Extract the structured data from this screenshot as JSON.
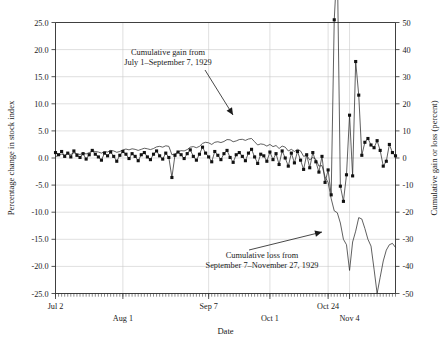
{
  "chart_data": {
    "type": "line",
    "title": "",
    "xlabel": "Date",
    "ylabel": "Percentage change in stock index",
    "y2label": "Cumulative gain or loss (percent)",
    "ylim": [
      -25.0,
      25.0
    ],
    "y2lim": [
      -50,
      50
    ],
    "grid": true,
    "legend_position": "none",
    "yticks": [
      "25.0",
      "20.0",
      "15.0",
      "10.0",
      "5.0",
      "0.0",
      "-5.0",
      "-10.0",
      "-15.0",
      "-20.0",
      "-25.0"
    ],
    "ytick_values": [
      25.0,
      20.0,
      15.0,
      10.0,
      5.0,
      0.0,
      -5.0,
      -10.0,
      -15.0,
      -20.0,
      -25.0
    ],
    "y2ticks": [
      "50",
      "40",
      "30",
      "20",
      "10",
      "0",
      "-10",
      "-20",
      "-30",
      "-40",
      "-50"
    ],
    "y2tick_values": [
      50,
      40,
      30,
      20,
      10,
      0,
      -10,
      -20,
      -30,
      -40,
      -50
    ],
    "xticks": [
      {
        "label": "Jul 2",
        "index": 0,
        "row": 0
      },
      {
        "label": "Aug 1",
        "index": 22,
        "row": 1
      },
      {
        "label": "Sep 7",
        "index": 50,
        "row": 0
      },
      {
        "label": "Oct 1",
        "index": 70,
        "row": 1
      },
      {
        "label": "Oct 24",
        "index": 89,
        "row": 0
      },
      {
        "label": "Nov 4",
        "index": 96,
        "row": 1
      }
    ],
    "n_points": 112,
    "annotations": [
      {
        "name": "cumulative-gain-annotation",
        "lines": [
          "Cumulative gain from",
          "July 1–September 7, 1929"
        ],
        "text_x": 168,
        "text_y": 55,
        "arrow_from_x": 205,
        "arrow_from_y": 70,
        "arrow_to_x": 233,
        "arrow_to_y": 115
      },
      {
        "name": "cumulative-loss-annotation",
        "lines": [
          "Cumulative loss from",
          "September 7–November 27, 1929"
        ],
        "text_x": 262,
        "text_y": 258,
        "arrow_from_x": 249,
        "arrow_from_y": 250,
        "arrow_to_x": 322,
        "arrow_to_y": 232
      }
    ],
    "series": [
      {
        "name": "Percentage change in stock index",
        "axis": "left",
        "marker": "square",
        "values": [
          1.0,
          0.6,
          1.2,
          0.3,
          0.9,
          0.2,
          1.3,
          0.5,
          0.1,
          0.8,
          -0.2,
          0.6,
          1.4,
          0.7,
          0.2,
          -0.4,
          0.9,
          0.4,
          1.1,
          0.3,
          -0.6,
          0.5,
          1.2,
          0.7,
          -0.1,
          0.8,
          0.3,
          -0.5,
          0.6,
          1.0,
          0.2,
          -0.3,
          0.7,
          1.3,
          0.4,
          -0.2,
          0.9,
          0.1,
          -3.6,
          0.5,
          1.1,
          0.6,
          -0.1,
          0.8,
          1.5,
          0.3,
          -0.4,
          0.7,
          2.0,
          0.9,
          0.2,
          -0.7,
          1.2,
          0.5,
          -0.3,
          0.8,
          1.4,
          0.1,
          -0.8,
          0.6,
          1.0,
          0.3,
          -0.5,
          0.9,
          1.6,
          0.2,
          -1.0,
          0.7,
          0.4,
          -0.6,
          1.1,
          -0.3,
          0.8,
          -1.2,
          1.3,
          0.0,
          -1.5,
          0.9,
          -0.9,
          1.2,
          -0.4,
          -2.1,
          0.6,
          -1.8,
          1.0,
          -0.7,
          -2.6,
          0.3,
          -4.5,
          -2.2,
          -6.8,
          25.5,
          36.2,
          -5.2,
          -8.0,
          -3.1,
          7.9,
          -3.3,
          17.8,
          11.6,
          0.5,
          2.9,
          3.6,
          2.4,
          1.9,
          3.2,
          1.4,
          -1.5,
          -0.6,
          2.5,
          1.0,
          0.4
        ]
      },
      {
        "name": "Cumulative gain or loss",
        "axis": "right",
        "marker": "none",
        "values": [
          0.5,
          1.0,
          1.4,
          1.1,
          1.6,
          1.3,
          1.9,
          1.6,
          1.3,
          1.8,
          1.5,
          2.0,
          2.6,
          2.4,
          2.2,
          1.8,
          2.4,
          2.2,
          2.8,
          2.6,
          2.1,
          2.4,
          3.0,
          3.3,
          3.0,
          3.4,
          3.2,
          2.8,
          3.2,
          3.6,
          3.4,
          3.1,
          3.5,
          4.1,
          4.3,
          4.0,
          4.5,
          4.3,
          1.2,
          1.5,
          2.3,
          2.7,
          2.6,
          3.1,
          4.0,
          4.2,
          3.8,
          4.3,
          5.4,
          5.8,
          5.6,
          5.0,
          5.8,
          6.0,
          5.7,
          6.1,
          6.8,
          6.7,
          6.0,
          6.3,
          6.8,
          6.9,
          6.5,
          7.0,
          7.2,
          6.0,
          4.8,
          5.2,
          5.0,
          4.4,
          5.0,
          4.2,
          4.6,
          3.5,
          4.4,
          4.0,
          2.6,
          3.2,
          2.4,
          3.2,
          2.6,
          0.6,
          1.0,
          -0.7,
          0.2,
          -0.5,
          -3.0,
          -2.8,
          -7.0,
          -9.0,
          -15.0,
          -19.5,
          -20.2,
          -24.0,
          -30.0,
          -32.0,
          -41.5,
          -31.0,
          -27.0,
          -22.0,
          -22.5,
          -26.0,
          -30.0,
          -32.5,
          -41.0,
          -50.0,
          -44.0,
          -38.0,
          -34.0,
          -32.0,
          -31.5,
          -33.0
        ]
      }
    ]
  }
}
